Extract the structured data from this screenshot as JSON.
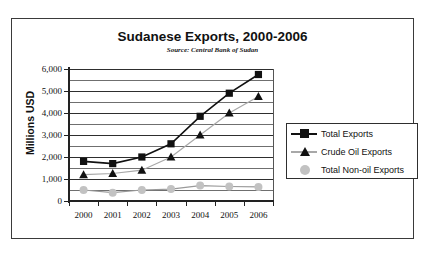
{
  "chart_data": {
    "type": "line",
    "title": "Sudanese Exports, 2000-2006",
    "subtitle": "Source:  Central Bank of Sudan",
    "xlabel": "",
    "ylabel": "Millions USD",
    "categories": [
      "2000",
      "2001",
      "2002",
      "2003",
      "2004",
      "2005",
      "2006"
    ],
    "ylim": [
      0,
      6000
    ],
    "ytick_step": 1000,
    "yticks": [
      "0",
      "1,000",
      "2,000",
      "3,000",
      "4,000",
      "5,000",
      "6,000"
    ],
    "ytick_values": [
      0,
      1000,
      2000,
      3000,
      4000,
      5000,
      6000
    ],
    "minor_gridlines": true,
    "minor_tick_step": 500,
    "grid": true,
    "legend_position": "right",
    "series": [
      {
        "name": "Total Exports",
        "marker": "square",
        "color": "#111111",
        "line_color": "#111111",
        "values": [
          1800,
          1700,
          2000,
          2600,
          3850,
          4900,
          5750
        ]
      },
      {
        "name": "Crude Oil Exports",
        "marker": "triangle",
        "color": "#111111",
        "line_color": "#a8a8a8",
        "values": [
          1200,
          1250,
          1400,
          2000,
          3000,
          4000,
          4750
        ]
      },
      {
        "name": "Total Non-oil Exports",
        "marker": "circle",
        "color": "#c2c2c2",
        "line_color": "#9a9a9a",
        "values": [
          500,
          380,
          500,
          540,
          700,
          660,
          640
        ]
      }
    ]
  },
  "legend": {
    "items": [
      {
        "label": "Total Exports"
      },
      {
        "label": "Crude Oil Exports"
      },
      {
        "label": "Total Non-oil Exports"
      }
    ]
  }
}
